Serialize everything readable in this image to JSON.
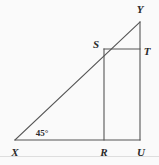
{
  "figure": {
    "background_color": "#fafafa",
    "line_color": "#555555",
    "label_color": "#2b2b2b",
    "width": 159,
    "height": 165
  },
  "points": {
    "X": {
      "label": "X",
      "x": 15,
      "y": 140,
      "label_x": 15,
      "label_y": 152
    },
    "Y": {
      "label": "Y",
      "x": 140,
      "y": 22,
      "label_x": 140,
      "label_y": 9
    },
    "U": {
      "label": "U",
      "x": 140,
      "y": 140,
      "label_x": 141,
      "label_y": 152
    },
    "R": {
      "label": "R",
      "x": 104,
      "y": 140,
      "label_x": 104,
      "label_y": 152
    },
    "S": {
      "label": "S",
      "x": 104,
      "y": 49,
      "label_x": 96,
      "label_y": 44
    },
    "T": {
      "label": "T",
      "x": 140,
      "y": 49,
      "label_x": 147,
      "label_y": 51
    }
  },
  "angles": [
    {
      "name": "angle-at-X",
      "text": "45°",
      "vertex": "X",
      "label_x": 42,
      "label_y": 133
    }
  ],
  "segments": [
    {
      "name": "base-XU",
      "from": "X",
      "to": "U"
    },
    {
      "name": "hypotenuse-XY",
      "from": "X",
      "to": "Y"
    },
    {
      "name": "vertical-YU",
      "from": "Y",
      "to": "U"
    },
    {
      "name": "vertical-SR",
      "from": "S",
      "to": "R"
    },
    {
      "name": "horizontal-ST",
      "from": "S",
      "to": "T"
    }
  ],
  "chart_data": {
    "type": "diagram",
    "vertices": [
      {
        "id": "X",
        "x": 15,
        "y": 140
      },
      {
        "id": "Y",
        "x": 140,
        "y": 22
      },
      {
        "id": "U",
        "x": 140,
        "y": 140
      },
      {
        "id": "R",
        "x": 104,
        "y": 140
      },
      {
        "id": "S",
        "x": 104,
        "y": 49
      },
      {
        "id": "T",
        "x": 140,
        "y": 49
      }
    ],
    "edges": [
      [
        "X",
        "U"
      ],
      [
        "X",
        "Y"
      ],
      [
        "Y",
        "U"
      ],
      [
        "S",
        "R"
      ],
      [
        "S",
        "T"
      ]
    ],
    "annotations": [
      "45° at vertex X"
    ]
  }
}
